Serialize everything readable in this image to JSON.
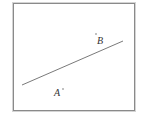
{
  "figure": {
    "frame": {
      "x": 13,
      "y": 3,
      "width": 122,
      "height": 108,
      "color": "#8a8a8a"
    },
    "line": {
      "x1": 22,
      "y1": 85,
      "x2": 123,
      "y2": 41,
      "color": "#6a6a6a"
    },
    "points": [
      {
        "label": "B",
        "dot_x": 96,
        "dot_y": 33,
        "text_x": 97,
        "text_y": 44
      },
      {
        "label": "A",
        "dot_x": 63,
        "dot_y": 91,
        "text_x": 54,
        "text_y": 96
      }
    ]
  }
}
